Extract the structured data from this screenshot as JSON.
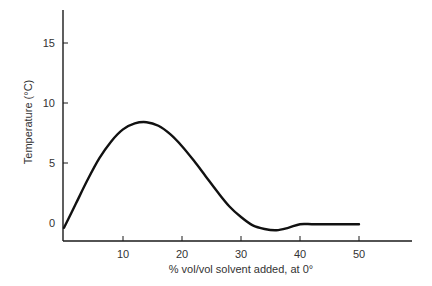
{
  "chart_data": {
    "type": "line",
    "title": "",
    "xlabel": "% vol/vol solvent added, at 0°",
    "ylabel": "Temperature (°C)",
    "xlim": [
      0,
      59
    ],
    "ylim": [
      -1.5,
      17.5
    ],
    "xticks": [
      10,
      20,
      30,
      40,
      50
    ],
    "xtick_labels": [
      "10",
      "20",
      "30",
      "40",
      "50"
    ],
    "yticks": [
      0,
      5,
      10,
      15
    ],
    "ytick_labels": [
      "0",
      "5",
      "10",
      "15"
    ],
    "grid": false,
    "legend": null,
    "series": [
      {
        "name": "temperature",
        "color": "#111111",
        "x": [
          0,
          2,
          4,
          6,
          8,
          10,
          12,
          14,
          16,
          18,
          20,
          22,
          24,
          26,
          28,
          30,
          32,
          34,
          36,
          38,
          40,
          42,
          44,
          46,
          48,
          50
        ],
        "y": [
          -0.4,
          1.6,
          3.6,
          5.4,
          6.8,
          7.8,
          8.3,
          8.4,
          8.1,
          7.4,
          6.4,
          5.2,
          3.9,
          2.6,
          1.4,
          0.5,
          -0.2,
          -0.5,
          -0.6,
          -0.4,
          -0.1,
          -0.1,
          -0.1,
          -0.1,
          -0.1,
          -0.1
        ]
      }
    ]
  }
}
